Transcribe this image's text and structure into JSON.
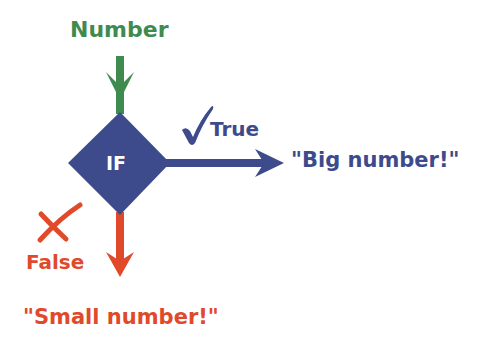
{
  "diagram": {
    "input_label": "Number",
    "decision_label": "IF",
    "true_label": "True",
    "true_output": "\"Big number!\"",
    "false_label": "False",
    "false_output": "\"Small number!\"",
    "icons": {
      "true": "checkmark-icon",
      "false": "cross-icon"
    },
    "colors": {
      "input": "#3f8a4f",
      "decision": "#3d4b8c",
      "true": "#3d4b8c",
      "false": "#e04a2a",
      "decision_text": "#ffffff"
    }
  }
}
